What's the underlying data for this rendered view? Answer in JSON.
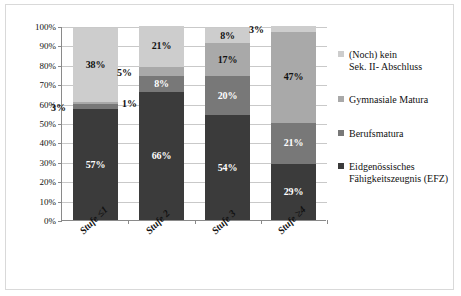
{
  "chart_data": {
    "type": "bar",
    "subtype": "100% stacked column",
    "title": "",
    "xlabel": "",
    "ylabel": "",
    "ylim": [
      0,
      100
    ],
    "yticks": [
      "0%",
      "10%",
      "20%",
      "30%",
      "40%",
      "50%",
      "60%",
      "70%",
      "80%",
      "90%",
      "100%"
    ],
    "ytick_values": [
      0,
      10,
      20,
      30,
      40,
      50,
      60,
      70,
      80,
      90,
      100
    ],
    "grid": true,
    "legend_position": "right",
    "categories": [
      "Stufe ≤1",
      "Stufe 2",
      "Stufe 3",
      "Stufe ≥4"
    ],
    "series": [
      {
        "name": "Eidgenössisches Fähigkeitszeugnis (EFZ)",
        "color": "#3b3b3b",
        "values": [
          57,
          66,
          54,
          29
        ],
        "labels": [
          "57%",
          "66%",
          "54%",
          "29%"
        ],
        "label_color": "#ffffff",
        "label_placement": [
          "inside",
          "inside",
          "inside",
          "inside"
        ]
      },
      {
        "name": "Berufsmatura",
        "color": "#787878",
        "values": [
          3,
          8,
          20,
          21
        ],
        "labels": [
          "3%",
          "8%",
          "20%",
          "21%"
        ],
        "label_color": "#ffffff",
        "label_placement": [
          "outside-left",
          "inside",
          "inside",
          "inside"
        ]
      },
      {
        "name": "Gymnasiale Matura",
        "color": "#a9a9a9",
        "values": [
          1,
          5,
          17,
          47
        ],
        "labels": [
          "1%",
          "5%",
          "17%",
          "47%"
        ],
        "label_color": "#111111",
        "label_placement": [
          "outside-right",
          "outside-left",
          "inside",
          "inside"
        ]
      },
      {
        "name": "(Noch) kein Sek. II- Abschluss",
        "color": "#cdcdcd",
        "values": [
          38,
          21,
          8,
          3
        ],
        "labels": [
          "38%",
          "21%",
          "8%",
          "3%"
        ],
        "label_color": "#111111",
        "label_placement": [
          "inside",
          "inside",
          "inside",
          "outside-left"
        ]
      }
    ]
  },
  "legend": {
    "items": [
      {
        "line1": "(Noch) kein",
        "line2": "Sek. II- Abschluss",
        "color": "#cdcdcd"
      },
      {
        "line1": "Gymnasiale Matura",
        "line2": "",
        "color": "#a9a9a9"
      },
      {
        "line1": "Berufsmatura",
        "line2": "",
        "color": "#787878"
      },
      {
        "line1": "Eidgenössisches",
        "line2": "Fähigkeitszeugnis (EFZ)",
        "color": "#3b3b3b"
      }
    ]
  },
  "outside_labels": {
    "bar1_berufsmatura": "3%",
    "bar1_gymmatura": "1%",
    "bar2_gymmatura": "5%",
    "bar4_keinabschluss": "3%"
  }
}
